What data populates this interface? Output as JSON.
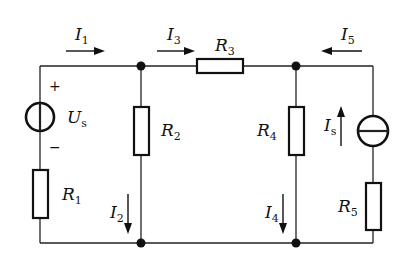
{
  "diagram": {
    "type": "circuit",
    "components": {
      "voltage_source": {
        "symbol": "U",
        "sub": "s",
        "plus": "+",
        "minus": "−"
      },
      "current_source": {
        "symbol": "I",
        "sub": "s"
      },
      "R1": {
        "symbol": "R",
        "sub": "1"
      },
      "R2": {
        "symbol": "R",
        "sub": "2"
      },
      "R3": {
        "symbol": "R",
        "sub": "3"
      },
      "R4": {
        "symbol": "R",
        "sub": "4"
      },
      "R5": {
        "symbol": "R",
        "sub": "5"
      }
    },
    "currents": {
      "I1": {
        "symbol": "I",
        "sub": "1",
        "direction": "right"
      },
      "I2": {
        "symbol": "I",
        "sub": "2",
        "direction": "down"
      },
      "I3": {
        "symbol": "I",
        "sub": "3",
        "direction": "right"
      },
      "I4": {
        "symbol": "I",
        "sub": "4",
        "direction": "down"
      },
      "I5": {
        "symbol": "I",
        "sub": "5",
        "direction": "left"
      }
    },
    "colors": {
      "line": "#111111",
      "background": "#ffffff"
    }
  }
}
